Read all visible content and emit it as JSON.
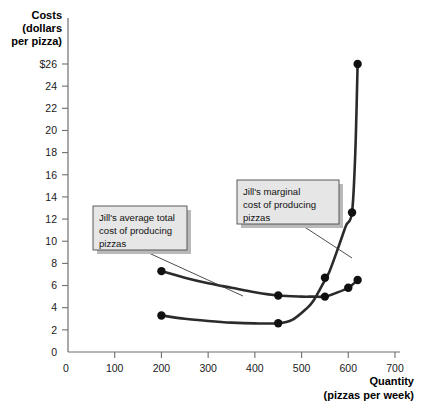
{
  "chart_data": {
    "type": "line",
    "title": "",
    "xlabel": "Quantity",
    "xlabel_sub": "(pizzas per week)",
    "ylabel": "Costs",
    "ylabel_sub1": "(dollars",
    "ylabel_sub2": "per pizza)",
    "xlim": [
      0,
      700
    ],
    "ylim": [
      0,
      26
    ],
    "grid": false,
    "legend": "annotations",
    "x_ticks": [
      0,
      100,
      200,
      300,
      400,
      500,
      600,
      700
    ],
    "x_ticklabels": [
      "0",
      "100",
      "200",
      "300",
      "400",
      "500",
      "600",
      "700"
    ],
    "y_ticks": [
      0,
      2,
      4,
      6,
      8,
      10,
      12,
      14,
      16,
      18,
      20,
      22,
      24,
      26
    ],
    "y_ticklabels": [
      "0",
      "2",
      "4",
      "6",
      "8",
      "10",
      "12",
      "14",
      "16",
      "18",
      "20",
      "22",
      "24",
      "$26"
    ],
    "series": [
      {
        "name": "Jill's average total cost of producing pizzas",
        "short": "ATC",
        "x": [
          200,
          450,
          550,
          600,
          620
        ],
        "values": [
          7.3,
          5.1,
          5.0,
          5.8,
          6.5
        ],
        "markers": true,
        "curve_x": [
          200,
          250,
          300,
          350,
          400,
          450,
          500,
          525,
          550,
          575,
          600,
          620
        ],
        "curve_y": [
          7.3,
          6.7,
          6.2,
          5.8,
          5.4,
          5.1,
          5.0,
          5.0,
          5.0,
          5.35,
          5.8,
          6.5
        ]
      },
      {
        "name": "Jill's marginal cost of producing pizzas",
        "short": "MC",
        "x": [
          200,
          450,
          550,
          608,
          620
        ],
        "values": [
          3.3,
          2.6,
          6.7,
          12.6,
          26.0
        ],
        "markers": true,
        "curve_x": [
          200,
          250,
          300,
          350,
          400,
          450,
          480,
          510,
          525,
          545,
          560,
          580,
          595,
          608,
          615,
          620
        ],
        "curve_y": [
          3.3,
          3.0,
          2.8,
          2.65,
          2.58,
          2.6,
          2.9,
          3.9,
          4.6,
          6.1,
          7.3,
          9.6,
          11.4,
          12.6,
          18.0,
          26.0
        ]
      }
    ],
    "annotations": [
      {
        "id": "atc-callout",
        "lines": [
          "Jill's average total",
          "cost of producing",
          "pizzas"
        ],
        "target_series": "ATC"
      },
      {
        "id": "mc-callout",
        "lines": [
          "Jill's marginal",
          "cost of producing",
          "pizzas"
        ],
        "target_series": "MC"
      }
    ],
    "colors": {
      "curve": "#2b2b2b",
      "marker": "#111111",
      "axis": "#6f6f6f",
      "callout_fill": "#e6e6e6",
      "callout_border": "#4a4a4a",
      "background": "#ffffff"
    }
  }
}
